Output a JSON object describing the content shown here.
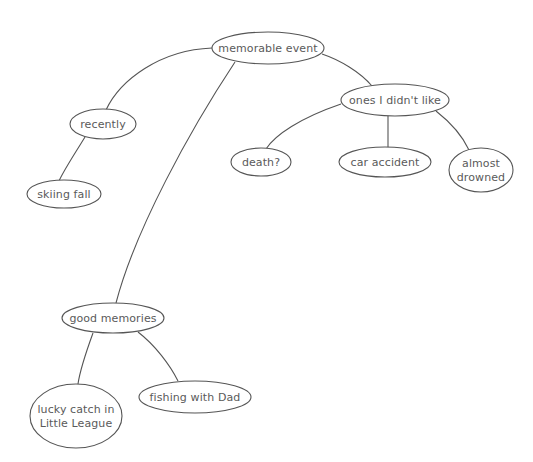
{
  "diagram": {
    "type": "cluster-map",
    "nodes": [
      {
        "id": "memorable",
        "lines": [
          "memorable event"
        ]
      },
      {
        "id": "recently",
        "lines": [
          "recently"
        ]
      },
      {
        "id": "skiing",
        "lines": [
          "skiing fall"
        ]
      },
      {
        "id": "didnt",
        "lines": [
          "ones I didn't like"
        ]
      },
      {
        "id": "death",
        "lines": [
          "death?"
        ]
      },
      {
        "id": "car",
        "lines": [
          "car accident"
        ]
      },
      {
        "id": "drowned",
        "lines": [
          "almost",
          "drowned"
        ]
      },
      {
        "id": "good",
        "lines": [
          "good memories"
        ]
      },
      {
        "id": "lucky",
        "lines": [
          "lucky catch in",
          "Little League"
        ]
      },
      {
        "id": "fishing",
        "lines": [
          "fishing with Dad"
        ]
      }
    ],
    "edges": [
      {
        "from": "memorable",
        "to": "recently"
      },
      {
        "from": "recently",
        "to": "skiing"
      },
      {
        "from": "memorable",
        "to": "didnt"
      },
      {
        "from": "didnt",
        "to": "death"
      },
      {
        "from": "didnt",
        "to": "car"
      },
      {
        "from": "didnt",
        "to": "drowned"
      },
      {
        "from": "memorable",
        "to": "good"
      },
      {
        "from": "good",
        "to": "lucky"
      },
      {
        "from": "good",
        "to": "fishing"
      }
    ]
  }
}
